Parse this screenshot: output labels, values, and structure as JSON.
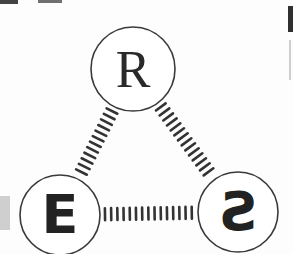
{
  "diagram": {
    "type": "triangle-graph",
    "nodes": [
      {
        "id": "R",
        "label": "R",
        "cx": 133,
        "cy": 69,
        "r": 42,
        "font": "serif"
      },
      {
        "id": "E",
        "label": "E",
        "cx": 60,
        "cy": 215,
        "r": 40,
        "font": "sans-bold"
      },
      {
        "id": "S",
        "label": "S",
        "cx": 238,
        "cy": 212,
        "r": 40,
        "font": "sans-mirrored"
      }
    ],
    "edges": [
      {
        "from": "R",
        "to": "E",
        "style": "ladder"
      },
      {
        "from": "R",
        "to": "S",
        "style": "ladder"
      },
      {
        "from": "E",
        "to": "S",
        "style": "ladder"
      }
    ],
    "colors": {
      "stroke": "#3a3a3a",
      "rung": "#333333",
      "background": "#ffffff",
      "artifact": "#222222"
    }
  }
}
